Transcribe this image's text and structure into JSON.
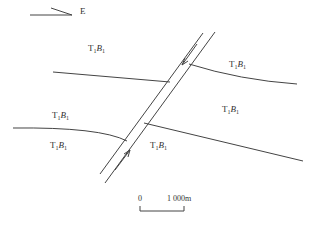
{
  "north_arrow": {
    "direction_label": "E"
  },
  "units": [
    {
      "id": "u1",
      "letter": "T",
      "sub1": "1",
      "letter2": "B",
      "sub2": "1",
      "x": 88,
      "y": 43
    },
    {
      "id": "u2",
      "letter": "T",
      "sub1": "1",
      "letter2": "B",
      "sub2": "1",
      "x": 229,
      "y": 59
    },
    {
      "id": "u3",
      "letter": "T",
      "sub1": "1",
      "letter2": "B",
      "sub2": "1",
      "x": 222,
      "y": 104
    },
    {
      "id": "u4",
      "letter": "T",
      "sub1": "1",
      "letter2": "B",
      "sub2": "1",
      "x": 52,
      "y": 110
    },
    {
      "id": "u5",
      "letter": "T",
      "sub1": "1",
      "letter2": "B",
      "sub2": "1",
      "x": 50,
      "y": 140
    },
    {
      "id": "u6",
      "letter": "T",
      "sub1": "1",
      "letter2": "B",
      "sub2": "1",
      "x": 150,
      "y": 140
    }
  ],
  "scale_bar": {
    "start_label": "0",
    "end_label": "1 000m"
  },
  "colors": {
    "line": "#444444"
  }
}
